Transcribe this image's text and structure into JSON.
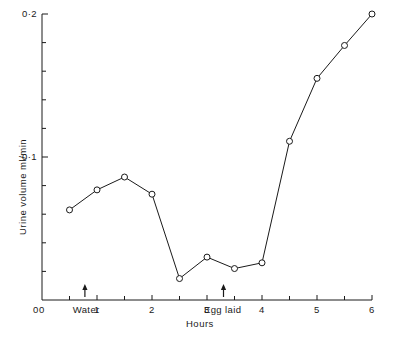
{
  "chart_data": {
    "type": "line",
    "title": "",
    "subtitle": "",
    "xlabel": "Hours",
    "ylabel": "Urine volume ml/min",
    "xlim": [
      0,
      6
    ],
    "ylim": [
      0,
      0.2
    ],
    "grid": false,
    "legend": null,
    "x_major_ticks": [
      0,
      1,
      2,
      3,
      4,
      5,
      6
    ],
    "x_major_tick_labels": [
      "0",
      "1",
      "2",
      "3",
      "4",
      "5",
      "6"
    ],
    "x_minor_ticks": [
      0.5,
      1.5,
      2.5,
      3.5,
      4.5,
      5.5
    ],
    "y_major_ticks": [
      0.1,
      0.2
    ],
    "y_major_tick_labels": [
      "0·1",
      "0·2"
    ],
    "y_minor_ticks": [
      0.02,
      0.04,
      0.06,
      0.08,
      0.12,
      0.14,
      0.16,
      0.18
    ],
    "marker": "open-circle",
    "line_color": "#1a1a1a",
    "marker_edge_color": "#1a1a1a",
    "marker_face_color": "#ffffff",
    "x": [
      0.5,
      1.0,
      1.5,
      2.0,
      2.5,
      3.0,
      3.5,
      4.0,
      4.5,
      5.0,
      5.5,
      6.0
    ],
    "values": [
      0.063,
      0.077,
      0.086,
      0.074,
      0.015,
      0.03,
      0.022,
      0.026,
      0.111,
      0.155,
      0.178,
      0.2
    ],
    "annotations": [
      {
        "label": "Water",
        "x": 0.78,
        "marker": "up-arrow"
      },
      {
        "label": "Egg laid",
        "x": 3.3,
        "marker": "up-arrow"
      }
    ]
  }
}
